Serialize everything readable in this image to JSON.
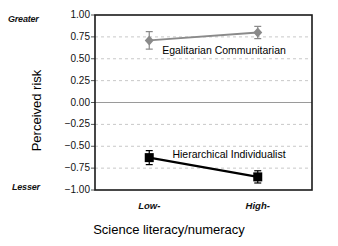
{
  "chart_data": {
    "type": "line",
    "title": "",
    "xlabel": "Science literacy/numeracy",
    "ylabel": "Perceived risk",
    "categories": [
      "Low-",
      "High-"
    ],
    "ylim": [
      -1.0,
      1.0
    ],
    "yticks": [
      "1.00",
      "0.75",
      "0.50",
      "0.25",
      "0.00",
      "-0.25",
      "-0.50",
      "-0.75",
      "-1.00"
    ],
    "ytick_values": [
      1.0,
      0.75,
      0.5,
      0.25,
      0.0,
      -0.25,
      -0.5,
      -0.75,
      -1.0
    ],
    "grid": true,
    "zero_line": true,
    "legend_position": "inline-annotation",
    "y_axis_high_anchor": "Greater",
    "y_axis_low_anchor": "Lesser",
    "series": [
      {
        "name": "Egalitarian Communitarian",
        "marker": "diamond",
        "color": "#8a8a8a",
        "values": [
          0.71,
          0.8
        ],
        "errors": [
          0.1,
          0.07
        ]
      },
      {
        "name": "Hierarchical Individualist",
        "marker": "square",
        "color": "#000000",
        "values": [
          -0.63,
          -0.85
        ],
        "errors": [
          0.08,
          0.07
        ]
      }
    ]
  },
  "colors": {
    "frame": "#1a1a1a",
    "gridline": "#c8c8c8",
    "zero_gridline": "#9a9a9a",
    "background": "#ffffff",
    "egalitarian": "#8a8a8a",
    "hierarchical": "#000000"
  }
}
